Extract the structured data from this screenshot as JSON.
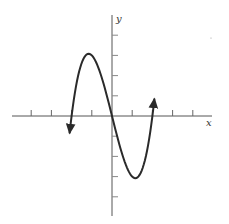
{
  "chart_data": {
    "type": "line",
    "title": "",
    "xlabel": "x",
    "ylabel": "y",
    "function": "y = x^3 - 4x",
    "xlim": [
      -5,
      5
    ],
    "ylim": [
      -5,
      5
    ],
    "tick_spacing": 1,
    "x_ticks": [
      -4,
      -3,
      -2,
      -1,
      1,
      2,
      3,
      4
    ],
    "y_ticks": [
      -4,
      -3,
      -2,
      -1,
      1,
      2,
      3,
      4
    ],
    "grid": false,
    "tick_labels_shown": false,
    "series": [
      {
        "name": "curve",
        "x": [
          -2.1,
          -2,
          -1.5,
          -1,
          -0.5,
          0,
          0.5,
          1,
          1.5,
          2,
          2.1
        ],
        "y": [
          -0.86,
          0,
          2.63,
          3,
          1.88,
          0,
          -1.88,
          -3,
          -2.63,
          0,
          0.86
        ],
        "arrows_at_ends": true
      }
    ],
    "key_points": {
      "local_max": [
        -1,
        3
      ],
      "local_min": [
        1,
        -3
      ],
      "zeros": [
        -2,
        0,
        2
      ]
    },
    "colors": {
      "curve": "#2a2a2a",
      "axes": "#555555"
    }
  }
}
